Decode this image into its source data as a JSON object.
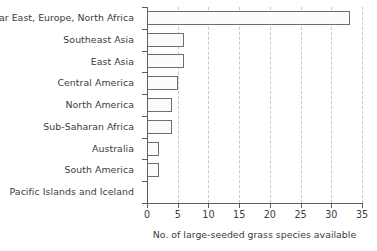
{
  "chart_data": {
    "type": "bar",
    "orientation": "horizontal",
    "title": "",
    "subtitle": "",
    "xlabel": "No. of large-seeded grass species available",
    "ylabel": "",
    "categories": [
      "Near East, Europe, North Africa",
      "Southeast Asia",
      "East Asia",
      "Central America",
      "North America",
      "Sub-Saharan Africa",
      "Australia",
      "South America",
      "Pacific Islands and Iceland"
    ],
    "values": [
      33,
      6,
      6,
      5,
      4,
      4,
      2,
      2,
      0
    ],
    "xlim": [
      0,
      35
    ],
    "xticks": [
      0,
      5,
      10,
      15,
      20,
      25,
      30,
      35
    ],
    "xtick_labels": [
      "0",
      "5",
      "10",
      "15",
      "20",
      "25",
      "30",
      "35"
    ],
    "grid": "vertical-dashed",
    "legend": "none",
    "bar_fill_color": "#fbfbfb",
    "bar_border_color": "#6e6e6e",
    "gridline_color": "#c9c9c9",
    "axis_color": "#5e5e5e",
    "background_color": "#ffffff"
  }
}
